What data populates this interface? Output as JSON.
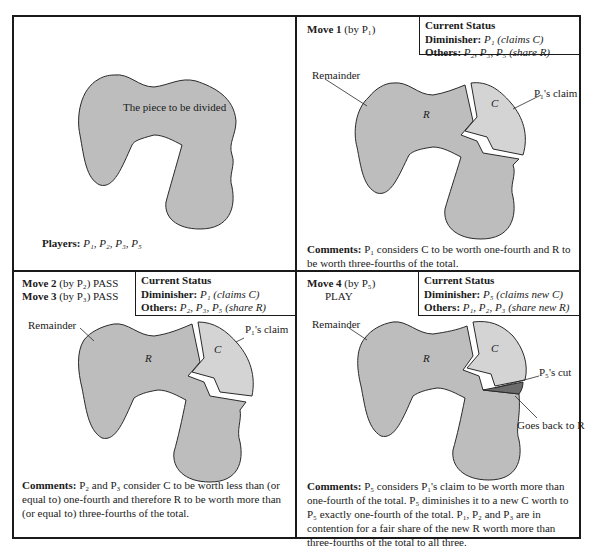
{
  "figure": {
    "colors": {
      "remainder_fill": "#bdbdbd",
      "claim_fill": "#d4d4d4",
      "cut_fill": "#6b6b6b",
      "outline": "#2a2a2a",
      "border": "#1a1a1a"
    },
    "panels": [
      {
        "id": "initial",
        "shape_label": "The piece to be divided",
        "players_label": "Players:",
        "players": [
          "P1",
          "P2",
          "P3",
          "P5"
        ],
        "players_text": "P₁, P₂, P₃, P₅"
      },
      {
        "id": "move1",
        "move_lines": [
          {
            "bold": "Move 1",
            "rest": "(by P₁)"
          }
        ],
        "status": {
          "title": "Current Status",
          "diminisher_label": "Diminisher:",
          "diminisher_value": "P₁  (claims C)",
          "others_label": "Others:",
          "others_value": "P₂, P₃, P₅  (share R)"
        },
        "labels": {
          "remainder": "Remainder",
          "claim": "P₁'s claim",
          "R": "R",
          "C": "C"
        },
        "comment_label": "Comments:",
        "comment_text": "P₁ considers C to be worth one-fourth and R to be worth three-fourths of the total."
      },
      {
        "id": "move2-3",
        "move_lines": [
          {
            "bold": "Move 2",
            "rest": "(by P₂) PASS"
          },
          {
            "bold": "Move 3",
            "rest": "(by P₃) PASS"
          }
        ],
        "status": {
          "title": "Current Status",
          "diminisher_label": "Diminisher:",
          "diminisher_value": "P₁  (claims C)",
          "others_label": "Others:",
          "others_value": "P₂, P₃, P₅  (share R)"
        },
        "labels": {
          "remainder": "Remainder",
          "claim": "P₁'s claim",
          "R": "R",
          "C": "C"
        },
        "comment_label": "Comments:",
        "comment_text": "P₂ and P₃ consider C to be worth less than (or equal to) one-fourth and therefore R to be worth more than (or equal to) three-fourths of the total."
      },
      {
        "id": "move4",
        "move_lines": [
          {
            "bold": "Move 4",
            "rest": "(by P₅)"
          },
          {
            "bold": "",
            "rest": "PLAY"
          }
        ],
        "status": {
          "title": "Current Status",
          "diminisher_label": "Diminisher:",
          "diminisher_value": "P₅  (claims new C)",
          "others_label": "Others:",
          "others_value": "P₁, P₂, P₃  (share new R)"
        },
        "labels": {
          "remainder": "Remainder",
          "cut": "P₅'s cut",
          "back": "Goes back to R",
          "R": "R",
          "C": "C"
        },
        "comment_label": "Comments:",
        "comment_text": "P₅ considers P₁'s claim to be worth more than one-fourth of the total. P₅ diminishes it to a new C worth to P₅ exactly one-fourth of the total. P₁, P₂ and P₃ are in contention for a fair share of the new R worth more than three-fourths of the total to all three."
      }
    ]
  }
}
